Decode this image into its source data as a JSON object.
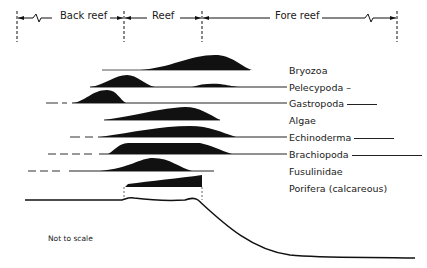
{
  "zones": [
    {
      "label": "Back reef",
      "x_start": 17,
      "x_end": 124
    },
    {
      "label": "Reef",
      "x_start": 124,
      "x_end": 202
    },
    {
      "label": "Fore reef",
      "x_start": 202,
      "x_end": 397
    }
  ],
  "taxa": [
    {
      "name": "Bryozoa",
      "y": 70
    },
    {
      "name": "Pelecypoda",
      "y": 87
    },
    {
      "name": "Gastropoda",
      "y": 103
    },
    {
      "name": "Algae",
      "y": 120
    },
    {
      "name": "Echinoderma",
      "y": 137
    },
    {
      "name": "Brachiopoda",
      "y": 154
    },
    {
      "name": "Fusulinidae",
      "y": 171
    },
    {
      "name": "Porifera (calcareous)",
      "y": 188
    }
  ],
  "note": "Not to scale",
  "colors": {
    "ink": "#111111",
    "background": "#ffffff"
  }
}
